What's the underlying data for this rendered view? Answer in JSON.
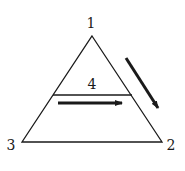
{
  "diagram": {
    "type": "ternary-triangle",
    "vertices": [
      {
        "id": "1",
        "label": "1",
        "position": "top"
      },
      {
        "id": "2",
        "label": "2",
        "position": "bottom-right"
      },
      {
        "id": "3",
        "label": "3",
        "position": "bottom-left"
      }
    ],
    "inner_line": {
      "label": "4"
    },
    "arrows": [
      {
        "name": "horizontal-arrow",
        "direction": "left-to-right",
        "below": "line-4"
      },
      {
        "name": "diagonal-arrow",
        "direction": "from vertex 1 toward vertex 2",
        "outside": "right edge"
      }
    ],
    "colors": {
      "stroke": "#1a1a1a",
      "background": "#ffffff"
    }
  }
}
